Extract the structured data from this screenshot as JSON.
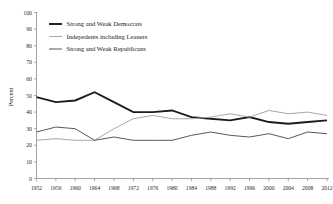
{
  "chart_data": {
    "type": "line",
    "title": "",
    "subtitle": "",
    "xlabel": "",
    "ylabel": "Percent",
    "ylim": [
      0,
      100
    ],
    "ytick_step": 10,
    "yticks": [
      "0",
      "10",
      "20",
      "30",
      "40",
      "50",
      "60",
      "70",
      "80",
      "90",
      "100"
    ],
    "grid": false,
    "legend_position": "top-left",
    "x": [
      1952,
      1956,
      1960,
      1964,
      1968,
      1972,
      1976,
      1980,
      1984,
      1988,
      1992,
      1996,
      2000,
      2004,
      2008,
      2012
    ],
    "xtick_labels": [
      "1952",
      "1956",
      "1960",
      "1964",
      "1968",
      "1972",
      "1976",
      "1980",
      "1984",
      "1988",
      "1992",
      "1996",
      "2000",
      "2004",
      "2008",
      "2012"
    ],
    "series": [
      {
        "name": "Strong and Weak Democrats",
        "color": "#1c1c1c",
        "width": 1.9,
        "values": [
          49,
          46,
          47,
          52,
          46,
          40,
          40,
          41,
          37,
          36,
          35,
          37,
          34,
          33,
          34,
          35
        ]
      },
      {
        "name": "Indepedents including Leaners",
        "color": "#a8a8a8",
        "width": 1.0,
        "values": [
          23,
          24,
          23,
          23,
          30,
          36,
          38,
          36,
          36,
          37,
          39,
          37,
          41,
          39,
          40,
          38
        ]
      },
      {
        "name": "Strong and Weak Republicans",
        "color": "#585858",
        "width": 1.0,
        "values": [
          28,
          31,
          30,
          23,
          25,
          23,
          23,
          23,
          26,
          28,
          26,
          25,
          27,
          24,
          28,
          27
        ]
      }
    ]
  },
  "legend": {
    "items": [
      {
        "label": "Strong and Weak Democrats"
      },
      {
        "label": "Indepedents including Leaners"
      },
      {
        "label": "Strong and Weak Republicans"
      }
    ]
  },
  "axes": {
    "y_axis_title": "Percent"
  }
}
